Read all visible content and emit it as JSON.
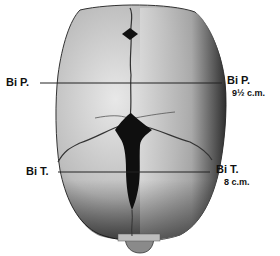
{
  "figure": {
    "measurements": [
      {
        "id": "biparietal",
        "left_label": "Bi P.",
        "right_label": "Bi P.",
        "value": "9½ c.m."
      },
      {
        "id": "bitemporal",
        "left_label": "Bi T.",
        "right_label": "Bi T.",
        "value": "8 c.m."
      }
    ]
  }
}
